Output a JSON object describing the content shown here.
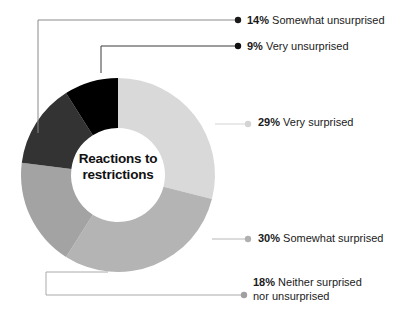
{
  "chart_data": {
    "type": "pie",
    "variant": "donut",
    "title": "Reactions to restrictions",
    "center_title_lines": [
      "Reactions to",
      "restrictions"
    ],
    "xlabel": "",
    "ylabel": "",
    "legend_position": "callout-labels",
    "grid": false,
    "start_angle_deg": 0,
    "direction": "clockwise",
    "units": "percent",
    "total": 100,
    "categories": [
      "Very surprised",
      "Somewhat surprised",
      "Neither surprised nor unsurprised",
      "Somewhat unsurprised",
      "Very unsurprised"
    ],
    "values": [
      29,
      30,
      18,
      14,
      9
    ],
    "slices": [
      {
        "id": "very-surprised",
        "percent_label": "29%",
        "value": 29,
        "label": "Very surprised",
        "label_line2": "",
        "color": "#d9d9d9",
        "dot_color": "#d4d4d4",
        "leader_color": "#d4d4d4",
        "start_deg": 0,
        "end_deg": 104.4
      },
      {
        "id": "somewhat-surprised",
        "percent_label": "30%",
        "value": 30,
        "label": "Somewhat surprised",
        "label_line2": "",
        "color": "#b4b4b4",
        "dot_color": "#b0b0b0",
        "leader_color": "#b8b8b8",
        "start_deg": 104.4,
        "end_deg": 212.4
      },
      {
        "id": "neither",
        "percent_label": "18%",
        "value": 18,
        "label": "Neither surprised",
        "label_line2": "nor unsurprised",
        "color": "#a3a3a3",
        "dot_color": "#a0a0a0",
        "leader_color": "#aaaaaa",
        "start_deg": 212.4,
        "end_deg": 277.2
      },
      {
        "id": "somewhat-unsurprised",
        "percent_label": "14%",
        "value": 14,
        "label": "Somewhat unsurprised",
        "label_line2": "",
        "color": "#333333",
        "dot_color": "#1a1a1a",
        "leader_color": "#8a8a8a",
        "start_deg": 277.2,
        "end_deg": 327.6
      },
      {
        "id": "very-unsurprised",
        "percent_label": "9%",
        "value": 9,
        "label": "Very unsurprised",
        "label_line2": "",
        "color": "#000000",
        "dot_color": "#111111",
        "leader_color": "#3a3a3a",
        "start_deg": 327.6,
        "end_deg": 360
      }
    ],
    "geometry": {
      "cx": 118,
      "cy": 175,
      "outer_radius": 97,
      "inner_radius": 47
    },
    "background": "#ffffff"
  }
}
